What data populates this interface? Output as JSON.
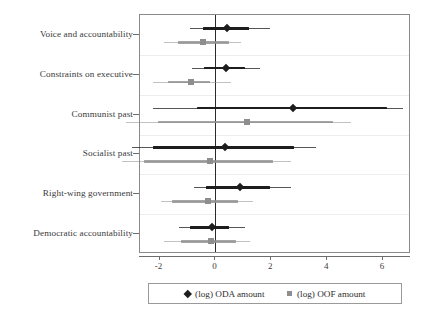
{
  "chart_data": {
    "type": "scatter",
    "subtype": "coefficient-plot",
    "title": "",
    "xlabel": "",
    "ylabel": "",
    "xlim": [
      -2.7,
      7.0
    ],
    "xticks": [
      -2,
      0,
      2,
      4,
      6
    ],
    "xticklabels": [
      "-2",
      "0",
      "2",
      "4",
      "6"
    ],
    "grid": true,
    "zero_reference_line": 0,
    "legend_position": "bottom",
    "categories": [
      "Voice and accountability",
      "Constraints on executive",
      "Communist past",
      "Socialist past",
      "Right-wing government",
      "Democratic accountability"
    ],
    "series": [
      {
        "name": "(log) ODA amount",
        "marker": "diamond",
        "color": "#1d1d1d",
        "values": [
          0.4,
          0.38,
          2.77,
          0.35,
          0.88,
          -0.14
        ],
        "ci_outer_low": [
          -0.9,
          -0.85,
          -2.25,
          -3.0,
          -0.75,
          -1.3
        ],
        "ci_outer_high": [
          1.95,
          1.6,
          6.7,
          3.6,
          2.7,
          1.05
        ],
        "ci_inner_low": [
          -0.45,
          -0.4,
          -0.65,
          -2.25,
          -0.35,
          -0.9
        ],
        "ci_inner_high": [
          1.2,
          1.05,
          6.15,
          2.8,
          1.95,
          0.5
        ]
      },
      {
        "name": "(log) OOF amount",
        "marker": "square",
        "color": "#8e8e8e",
        "values": [
          -0.46,
          -0.88,
          1.12,
          -0.2,
          -0.28,
          -0.15
        ],
        "ci_outer_low": [
          -1.85,
          -2.25,
          -3.2,
          -3.35,
          -1.95,
          -1.85
        ],
        "ci_outer_high": [
          0.9,
          0.55,
          4.85,
          2.7,
          1.35,
          1.25
        ],
        "ci_inner_low": [
          -1.35,
          -1.7,
          -2.05,
          -2.55,
          -1.55,
          -1.25
        ],
        "ci_inner_high": [
          0.5,
          -0.2,
          4.2,
          2.05,
          0.8,
          0.75
        ]
      }
    ]
  },
  "legend": {
    "entries": [
      {
        "label": "(log) ODA amount",
        "marker": "diamond-marker-icon"
      },
      {
        "label": "(log) OOF amount",
        "marker": "square-marker-icon"
      }
    ]
  }
}
